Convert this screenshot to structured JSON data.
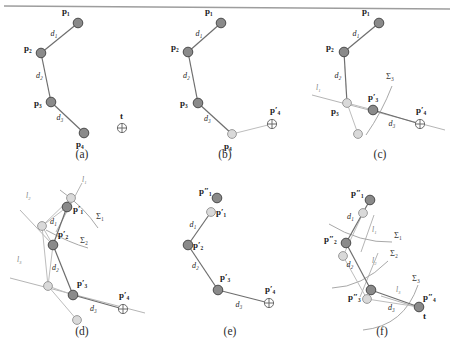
{
  "figure": {
    "kind": "inverse-kinematics-fabrik-diagram",
    "top_rule": true,
    "panel_captions": [
      "(a)",
      "(b)",
      "(c)",
      "(d)",
      "(e)",
      "(f)"
    ],
    "colors": {
      "joint_dark": "#8a8a8a",
      "joint_dark_stroke": "#4a4a4a",
      "joint_light": "#d9d9d9",
      "joint_light_stroke": "#9a9a9a",
      "link": "#6e6e6e",
      "ghost_link": "#bdbdbd",
      "constraint_line": "#b5b5b5",
      "arc": "#a8a8a8",
      "text": "#1a1a1a",
      "rule": "#9d9d9d"
    },
    "labels": {
      "p1": "p₁",
      "p2": "p₂",
      "p3": "p₃",
      "p4": "p₄",
      "p1p": "p′₁",
      "p2p": "p′₂",
      "p3p": "p′₃",
      "p4p": "p′₄",
      "p1pp": "p″₁",
      "p2pp": "p″₂",
      "p3pp": "p″₃",
      "p4pp": "p″₄",
      "t": "t",
      "d1": "d₁",
      "d2": "d₂",
      "d3": "d₃",
      "l1": "l₁",
      "l2": "l₂",
      "l3": "l₃",
      "S1": "Σ₁",
      "S2": "Σ₂",
      "S3": "Σ₃"
    }
  },
  "panels": [
    {
      "id": "a",
      "caption": "(a)",
      "joints": [
        {
          "name": "p1",
          "label": "p₁",
          "x": 78,
          "y": 23,
          "style": "dark",
          "lx": -16,
          "ly": -9
        },
        {
          "name": "p2",
          "label": "p₂",
          "x": 41,
          "y": 53,
          "style": "dark",
          "lx": -17,
          "ly": -2
        },
        {
          "name": "p3",
          "label": "p₃",
          "x": 51,
          "y": 102,
          "style": "dark",
          "lx": -17,
          "ly": 4
        },
        {
          "name": "p4",
          "label": "p₄",
          "x": 84,
          "y": 133,
          "style": "dark",
          "lx": -8,
          "ly": 14
        }
      ],
      "target": {
        "name": "t",
        "label": "t",
        "x": 122,
        "y": 128,
        "lx": -2,
        "ly": -9
      },
      "links": [
        {
          "from": "p1",
          "to": "p2",
          "label": "d₁",
          "lx": -9,
          "ly": -2
        },
        {
          "from": "p2",
          "to": "p3",
          "label": "d₂",
          "lx": -10,
          "ly": 0
        },
        {
          "from": "p3",
          "to": "p4",
          "label": "d₃",
          "lx": -11,
          "ly": 2
        }
      ],
      "lines": [],
      "arcs": [],
      "ghosts": []
    },
    {
      "id": "b",
      "caption": "(b)",
      "joints": [
        {
          "name": "p1",
          "label": "p₁",
          "x": 221,
          "y": 23,
          "style": "dark",
          "lx": -16,
          "ly": -9
        },
        {
          "name": "p2",
          "label": "p₂",
          "x": 188,
          "y": 52,
          "style": "dark",
          "lx": -17,
          "ly": -2
        },
        {
          "name": "p3",
          "label": "p₃",
          "x": 198,
          "y": 103,
          "style": "dark",
          "lx": -18,
          "ly": 3
        },
        {
          "name": "p4",
          "label": "p₄",
          "x": 232,
          "y": 134,
          "style": "light",
          "lx": -8,
          "ly": 15
        },
        {
          "name": "p4p",
          "label": "p′₄",
          "x": 272,
          "y": 124,
          "style": "target",
          "lx": -2,
          "ly": -11
        }
      ],
      "target": null,
      "links": [
        {
          "from": "p1",
          "to": "p2",
          "label": "d₁",
          "lx": -9,
          "ly": -2
        },
        {
          "from": "p2",
          "to": "p3",
          "label": "d₂",
          "lx": -10,
          "ly": 0
        },
        {
          "from": "p3",
          "to": "p4",
          "label": "d₃",
          "lx": -11,
          "ly": 2
        }
      ],
      "ghost_links": [
        {
          "from": "p4",
          "to": "p4p"
        }
      ],
      "lines": [],
      "arcs": []
    },
    {
      "id": "c",
      "caption": "(c)",
      "joints": [
        {
          "name": "p1",
          "label": "p₁",
          "x": 379,
          "y": 23,
          "style": "dark",
          "lx": -17,
          "ly": -9
        },
        {
          "name": "p2",
          "label": "p₂",
          "x": 344,
          "y": 52,
          "style": "dark",
          "lx": -18,
          "ly": -2
        },
        {
          "name": "p3",
          "label": "p₃",
          "x": 347,
          "y": 103,
          "style": "light",
          "lx": -16,
          "ly": 11
        },
        {
          "name": "p3p",
          "label": "p′₃",
          "x": 373,
          "y": 110,
          "style": "dark",
          "lx": -5,
          "ly": -10
        },
        {
          "name": "p4p",
          "label": "p′₄",
          "x": 420,
          "y": 124,
          "style": "target",
          "lx": -4,
          "ly": -11
        },
        {
          "name": "p4g",
          "label": "",
          "x": 358,
          "y": 134,
          "style": "light",
          "lx": 0,
          "ly": 0
        }
      ],
      "target": null,
      "links": [
        {
          "from": "p1",
          "to": "p2",
          "label": "d₁",
          "lx": -9,
          "ly": -2
        },
        {
          "from": "p2",
          "to": "p3",
          "label": "d₂",
          "lx": -11,
          "ly": 0
        },
        {
          "from": "p3p",
          "to": "p4p",
          "label": "d₃",
          "lx": -8,
          "ly": 9
        }
      ],
      "ghost_links": [
        {
          "from": "p3",
          "to": "p3p"
        },
        {
          "from": "p3",
          "to": "p4g"
        }
      ],
      "lines": [
        {
          "name": "l1",
          "label": "l₁",
          "x1": 312,
          "y1": 95,
          "x2": 445,
          "y2": 130,
          "lx": 316,
          "ly": 90
        }
      ],
      "arcs": [
        {
          "name": "S3",
          "label": "Σ₃",
          "d": "M 366 135 Q 382 112 392 86",
          "lx": 386,
          "ly": 79
        }
      ]
    },
    {
      "id": "d",
      "caption": "(d)",
      "joints": [
        {
          "name": "p1p",
          "label": "p′₁",
          "x": 67,
          "y": 207,
          "style": "dark",
          "lx": 6,
          "ly": 5
        },
        {
          "name": "p1g",
          "label": "",
          "x": 71,
          "y": 198,
          "style": "light",
          "lx": 0,
          "ly": 0
        },
        {
          "name": "p2g",
          "label": "",
          "x": 42,
          "y": 226,
          "style": "light",
          "lx": 0,
          "ly": 0
        },
        {
          "name": "p2p",
          "label": "p′₂",
          "x": 53,
          "y": 245,
          "style": "dark",
          "lx": 5,
          "ly": -8
        },
        {
          "name": "p3g",
          "label": "",
          "x": 48,
          "y": 286,
          "style": "light",
          "lx": 0,
          "ly": 0
        },
        {
          "name": "p3p",
          "label": "p′₃",
          "x": 73,
          "y": 295,
          "style": "dark",
          "lx": 4,
          "ly": -9
        },
        {
          "name": "p4g2",
          "label": "",
          "x": 77,
          "y": 320,
          "style": "light",
          "lx": 0,
          "ly": 0
        },
        {
          "name": "p4p",
          "label": "p′₄",
          "x": 123,
          "y": 309,
          "style": "target",
          "lx": -4,
          "ly": -11
        }
      ],
      "target": null,
      "links": [
        {
          "from": "p1p",
          "to": "p2p",
          "label": "d₁",
          "lx": -10,
          "ly": -2
        },
        {
          "from": "p2p",
          "to": "p3p",
          "label": "d₂",
          "lx": -11,
          "ly": 0
        },
        {
          "from": "p3p",
          "to": "p4p",
          "label": "d₃",
          "lx": -8,
          "ly": 9
        }
      ],
      "ghost_links": [
        {
          "from": "p2g",
          "to": "p1p"
        },
        {
          "from": "p2g",
          "to": "p1g"
        },
        {
          "from": "p2g",
          "to": "p2p"
        },
        {
          "from": "p2g",
          "to": "p3g"
        },
        {
          "from": "p3g",
          "to": "p3p"
        },
        {
          "from": "p3g",
          "to": "p4g2"
        },
        {
          "from": "p2p",
          "to": "p3g"
        }
      ],
      "lines": [
        {
          "name": "l1",
          "label": "l₁",
          "x1": 56,
          "y1": 232,
          "x2": 82,
          "y2": 183,
          "lx": 82,
          "ly": 182
        },
        {
          "name": "l2",
          "label": "l₂",
          "x1": 20,
          "y1": 210,
          "x2": 52,
          "y2": 244,
          "lx": 26,
          "ly": 198
        },
        {
          "name": "l3",
          "label": "l₃",
          "x1": 10,
          "y1": 278,
          "x2": 145,
          "y2": 313,
          "lx": 17,
          "ly": 262
        }
      ],
      "arcs": [
        {
          "name": "S1",
          "label": "Σ₁",
          "d": "M 60 190 Q 84 207 98 228",
          "lx": 96,
          "ly": 219
        },
        {
          "name": "S2",
          "label": "Σ₂",
          "d": "M 46 230 Q 70 243 88 248",
          "lx": 80,
          "ly": 243
        }
      ]
    },
    {
      "id": "e",
      "caption": "(e)",
      "joints": [
        {
          "name": "p1pp",
          "label": "p″₁",
          "x": 217,
          "y": 198,
          "style": "dark",
          "lx": -18,
          "ly": -4
        },
        {
          "name": "p1p",
          "label": "p′₁",
          "x": 211,
          "y": 212,
          "style": "light",
          "lx": 5,
          "ly": 3
        },
        {
          "name": "p2p",
          "label": "p′₂",
          "x": 188,
          "y": 245,
          "style": "dark",
          "lx": 5,
          "ly": 3
        },
        {
          "name": "p3p",
          "label": "p′₃",
          "x": 218,
          "y": 290,
          "style": "dark",
          "lx": 2,
          "ly": -10
        },
        {
          "name": "p4p",
          "label": "p′₄",
          "x": 269,
          "y": 303,
          "style": "target",
          "lx": -4,
          "ly": -11
        }
      ],
      "target": null,
      "links": [
        {
          "from": "p1p",
          "to": "p2p",
          "label": "d₁",
          "lx": -10,
          "ly": -2
        },
        {
          "from": "p2p",
          "to": "p3p",
          "label": "d₂",
          "lx": -11,
          "ly": 0
        },
        {
          "from": "p3p",
          "to": "p4p",
          "label": "d₃",
          "lx": -8,
          "ly": 10
        }
      ],
      "ghost_links": [],
      "lines": [],
      "arcs": []
    },
    {
      "id": "f",
      "caption": "(f)",
      "joints": [
        {
          "name": "p1pp",
          "label": "p″₁",
          "x": 370,
          "y": 200,
          "style": "dark",
          "lx": -19,
          "ly": -4
        },
        {
          "name": "p1g",
          "label": "",
          "x": 363,
          "y": 213,
          "style": "light",
          "lx": 0,
          "ly": 0
        },
        {
          "name": "p2pp",
          "label": "p″₂",
          "x": 346,
          "y": 243,
          "style": "dark",
          "lx": -22,
          "ly": -1
        },
        {
          "name": "p2g",
          "label": "",
          "x": 343,
          "y": 256,
          "style": "light",
          "lx": 0,
          "ly": 0
        },
        {
          "name": "p3pp",
          "label": "p″₃",
          "x": 371,
          "y": 290,
          "style": "dark",
          "lx": -23,
          "ly": 10
        },
        {
          "name": "p3g",
          "label": "",
          "x": 367,
          "y": 299,
          "style": "light",
          "lx": 0,
          "ly": 0
        },
        {
          "name": "p4pp",
          "label": "p″₄",
          "x": 419,
          "y": 307,
          "style": "dark",
          "lx": 4,
          "ly": -7
        }
      ],
      "target": {
        "name": "t",
        "label": "t",
        "x": 419,
        "y": 307,
        "lx": 4,
        "ly": 12,
        "hidden_marker": true
      },
      "links": [
        {
          "from": "p1pp",
          "to": "p2pp",
          "label": "d₁",
          "lx": -11,
          "ly": -3
        },
        {
          "from": "p2pp",
          "to": "p3pp",
          "label": "d₂",
          "lx": -12,
          "ly": 0
        },
        {
          "from": "p3pp",
          "to": "p4pp",
          "label": "d₃",
          "lx": -7,
          "ly": 11
        }
      ],
      "ghost_links": [
        {
          "from": "p1g",
          "to": "p2g"
        },
        {
          "from": "p2g",
          "to": "p3g"
        },
        {
          "from": "p3g",
          "to": "p4pp"
        }
      ],
      "lines": [
        {
          "name": "l1",
          "label": "l₁",
          "x1": 361,
          "y1": 252,
          "x2": 374,
          "y2": 215,
          "lx": 372,
          "ly": 232
        },
        {
          "name": "l2",
          "label": "l₂",
          "x1": 360,
          "y1": 297,
          "x2": 378,
          "y2": 253,
          "lx": 372,
          "ly": 263
        },
        {
          "name": "l3",
          "label": "l₃",
          "x1": 381,
          "y1": 296,
          "x2": 413,
          "y2": 306,
          "lx": 396,
          "ly": 292
        }
      ],
      "arcs": [
        {
          "name": "S1",
          "label": "Σ₁",
          "d": "M 329 224 Q 360 243 392 242",
          "lx": 394,
          "ly": 238
        },
        {
          "name": "S2",
          "label": "Σ₂",
          "d": "M 332 288 Q 362 287 388 261",
          "lx": 390,
          "ly": 256
        },
        {
          "name": "S3",
          "label": "Σ₃",
          "d": "M 363 330 Q 404 326 418 285",
          "lx": 412,
          "ly": 281
        }
      ]
    }
  ]
}
